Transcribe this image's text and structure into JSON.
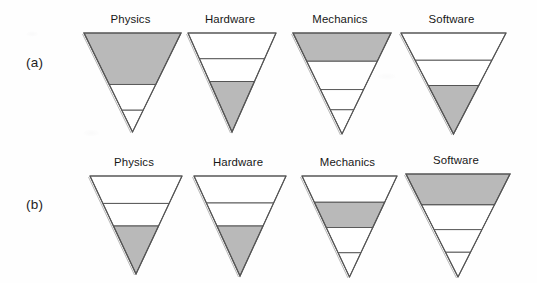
{
  "figure": {
    "background_color": "#fefefe",
    "outline_color": "#555555",
    "shaded_fill_color": "#b9b9b9",
    "empty_fill_color": "#ffffff",
    "text_color": "#171717"
  },
  "rows": [
    {
      "label": "(a)",
      "triangles": [
        {
          "title": "Physics",
          "x": 82,
          "y": 31,
          "width": 97,
          "height": 99,
          "bands": [
            {
              "from": 0.0,
              "to": 0.52,
              "shaded": true
            },
            {
              "from": 0.52,
              "to": 0.78,
              "shaded": false
            },
            {
              "from": 0.78,
              "to": 1.0,
              "shaded": false
            }
          ]
        },
        {
          "title": "Hardware",
          "x": 186,
          "y": 31,
          "width": 88,
          "height": 99,
          "bands": [
            {
              "from": 0.0,
              "to": 0.26,
              "shaded": false
            },
            {
              "from": 0.26,
              "to": 0.49,
              "shaded": false
            },
            {
              "from": 0.49,
              "to": 1.0,
              "shaded": true
            }
          ]
        },
        {
          "title": "Mechanics",
          "x": 291,
          "y": 31,
          "width": 98,
          "height": 101,
          "bands": [
            {
              "from": 0.0,
              "to": 0.28,
              "shaded": true
            },
            {
              "from": 0.28,
              "to": 0.56,
              "shaded": false
            },
            {
              "from": 0.56,
              "to": 0.76,
              "shaded": false
            },
            {
              "from": 0.76,
              "to": 1.0,
              "shaded": false
            }
          ]
        },
        {
          "title": "Software",
          "x": 399,
          "y": 31,
          "width": 105,
          "height": 101,
          "bands": [
            {
              "from": 0.0,
              "to": 0.27,
              "shaded": false
            },
            {
              "from": 0.27,
              "to": 0.52,
              "shaded": false
            },
            {
              "from": 0.52,
              "to": 1.0,
              "shaded": true
            }
          ]
        }
      ]
    },
    {
      "label": "(b)",
      "triangles": [
        {
          "title": "Physics",
          "x": 88,
          "y": 33,
          "width": 92,
          "height": 98,
          "bands": [
            {
              "from": 0.0,
              "to": 0.28,
              "shaded": false
            },
            {
              "from": 0.28,
              "to": 0.51,
              "shaded": false
            },
            {
              "from": 0.51,
              "to": 1.0,
              "shaded": true
            }
          ]
        },
        {
          "title": "Hardware",
          "x": 192,
          "y": 33,
          "width": 92,
          "height": 100,
          "bands": [
            {
              "from": 0.0,
              "to": 0.27,
              "shaded": false
            },
            {
              "from": 0.27,
              "to": 0.5,
              "shaded": false
            },
            {
              "from": 0.5,
              "to": 1.0,
              "shaded": true
            }
          ]
        },
        {
          "title": "Mechanics",
          "x": 300,
          "y": 33,
          "width": 95,
          "height": 101,
          "bands": [
            {
              "from": 0.0,
              "to": 0.26,
              "shaded": false
            },
            {
              "from": 0.26,
              "to": 0.51,
              "shaded": true
            },
            {
              "from": 0.51,
              "to": 0.76,
              "shaded": false
            },
            {
              "from": 0.76,
              "to": 1.0,
              "shaded": false
            }
          ]
        },
        {
          "title": "Software",
          "x": 404,
          "y": 31,
          "width": 104,
          "height": 103,
          "bands": [
            {
              "from": 0.0,
              "to": 0.3,
              "shaded": true
            },
            {
              "from": 0.3,
              "to": 0.54,
              "shaded": false
            },
            {
              "from": 0.54,
              "to": 0.76,
              "shaded": false
            },
            {
              "from": 0.76,
              "to": 1.0,
              "shaded": false
            }
          ]
        }
      ]
    }
  ]
}
